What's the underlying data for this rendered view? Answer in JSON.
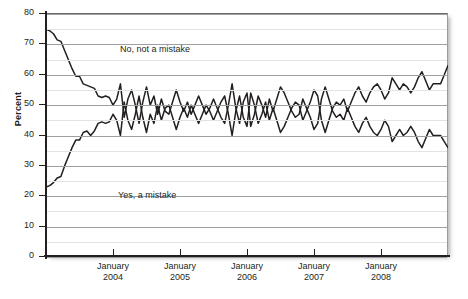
{
  "chart_data": {
    "type": "line",
    "title": "",
    "xlabel": "",
    "ylabel": "Percent",
    "ylim": [
      0,
      80
    ],
    "ytick_values": [
      0,
      10,
      20,
      30,
      40,
      50,
      60,
      70,
      80
    ],
    "ytick_labels": [
      "0",
      "10",
      "20",
      "30",
      "40",
      "50",
      "60",
      "70",
      "80"
    ],
    "minor_gridlines_every": 5,
    "grid": true,
    "legend_position": "inline-annotations",
    "xtick_labels": [
      {
        "line1": "January",
        "line2": "2004"
      },
      {
        "line1": "January",
        "line2": "2005"
      },
      {
        "line1": "January",
        "line2": "2006"
      },
      {
        "line1": "January",
        "line2": "2007"
      },
      {
        "line1": "January",
        "line2": "2008"
      }
    ],
    "xtick_positions_frac": [
      0.167,
      0.333,
      0.5,
      0.667,
      0.834
    ],
    "x_range_label": "2003 to 2009",
    "series": [
      {
        "name": "No, not a mistake",
        "color": "#231f20",
        "annotation": "No, not a mistake",
        "values": [
          75,
          74.5,
          73.5,
          71.5,
          71,
          68,
          65,
          62,
          59.5,
          59.5,
          57,
          56.5,
          56,
          55.5,
          53,
          52.5,
          53,
          52.5,
          50,
          52,
          57,
          46,
          52,
          55,
          50,
          44,
          51,
          56,
          50,
          53,
          47,
          52,
          48,
          47,
          51,
          55,
          51,
          48,
          51,
          47,
          50,
          53,
          50,
          47,
          49,
          52,
          49,
          46,
          44,
          50,
          57,
          49,
          44,
          51,
          54,
          43,
          47,
          53,
          50,
          46,
          52,
          48,
          52,
          56,
          54,
          51,
          48,
          46,
          47,
          52,
          49,
          46,
          42,
          44,
          52,
          56,
          52,
          48,
          46,
          47,
          45,
          49,
          46,
          43,
          41,
          44,
          46,
          43,
          41,
          40,
          42,
          45,
          43,
          38,
          40,
          42,
          40,
          41,
          43,
          41,
          38,
          36,
          39,
          42,
          40,
          40,
          40,
          38,
          36
        ]
      },
      {
        "name": "Yes, a mistake",
        "color": "#231f20",
        "annotation": "Yes, a mistake",
        "values": [
          23,
          23.5,
          24.5,
          26,
          26.5,
          30,
          33,
          36,
          38.5,
          38.5,
          41,
          41.5,
          40,
          41.5,
          44,
          44.5,
          44,
          44.5,
          47,
          45,
          40,
          51,
          45,
          42,
          47,
          53,
          46,
          41,
          47,
          44,
          50,
          45,
          49,
          50,
          46,
          42,
          46,
          49,
          46,
          50,
          47,
          44,
          47,
          50,
          48,
          45,
          48,
          51,
          53,
          47,
          40,
          48,
          53,
          46,
          43,
          54,
          50,
          44,
          47,
          51,
          45,
          49,
          45,
          41,
          43,
          46,
          49,
          51,
          50,
          45,
          48,
          51,
          55,
          53,
          45,
          41,
          45,
          49,
          51,
          50,
          52,
          48,
          51,
          54,
          56,
          53,
          51,
          54,
          56,
          57,
          55,
          52,
          54,
          59,
          57,
          55,
          57,
          56,
          54,
          56,
          59,
          61,
          58,
          55,
          57,
          57,
          57,
          60,
          63
        ]
      }
    ]
  }
}
